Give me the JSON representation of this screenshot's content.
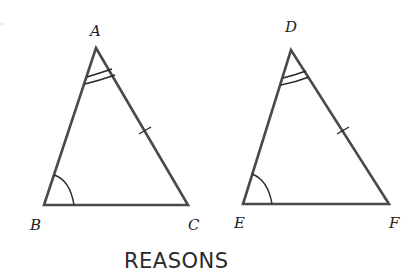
{
  "diagram": {
    "triangle_1": {
      "vertices": {
        "A": "A",
        "B": "B",
        "C": "C"
      },
      "marks": {
        "angle_A": "double arc",
        "angle_B": "single arc",
        "side_AC": "single tick"
      }
    },
    "triangle_2": {
      "vertices": {
        "D": "D",
        "E": "E",
        "F": "F"
      },
      "marks": {
        "angle_D": "double arc",
        "angle_E": "single arc",
        "side_DF": "single tick"
      }
    },
    "caption": "REASONS",
    "colors": {
      "line": "#4a4a4a",
      "mark": "#2a2a2a",
      "text": "#222222",
      "background": "#ffffff"
    }
  }
}
